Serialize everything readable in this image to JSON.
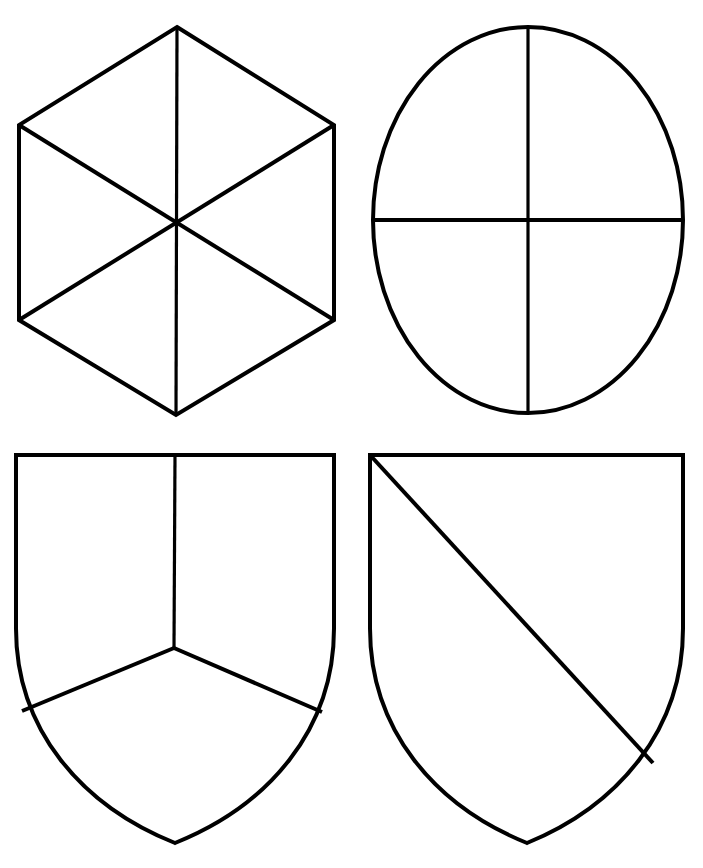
{
  "page": {
    "background_color": "#ffffff",
    "stroke_color": "#000000",
    "fill_color": "#ffffff",
    "width": 703,
    "height": 868
  },
  "figures": [
    {
      "id": "hexagon-gyronny",
      "name": "hexagon-divided-in-six",
      "shape": "hexagon",
      "divisions": 6,
      "division_type": "three-diameters-through-center",
      "stroke_width": 4,
      "vertices": [
        [
          177,
          27
        ],
        [
          334,
          125
        ],
        [
          334,
          320
        ],
        [
          176,
          415
        ],
        [
          19,
          320
        ],
        [
          19,
          125
        ]
      ],
      "center": [
        176,
        221
      ],
      "division_lines": [
        [
          [
            177,
            27
          ],
          [
            176,
            415
          ]
        ],
        [
          [
            19,
            125
          ],
          [
            334,
            320
          ]
        ],
        [
          [
            334,
            125
          ],
          [
            19,
            320
          ]
        ]
      ]
    },
    {
      "id": "ellipse-quartered",
      "name": "ellipse-quartered",
      "shape": "ellipse",
      "divisions": 4,
      "division_type": "vertical-and-horizontal-diameter",
      "stroke_width": 4,
      "center": [
        528,
        220
      ],
      "radius_x": 155,
      "radius_y": 193,
      "division_lines": [
        [
          [
            528,
            27
          ],
          [
            528,
            414
          ]
        ],
        [
          [
            373,
            220
          ],
          [
            683,
            220
          ]
        ]
      ]
    },
    {
      "id": "shield-per-pall",
      "name": "shield-party-per-pall",
      "shape": "shield",
      "divisions": 3,
      "division_type": "party-per-pall",
      "stroke_width": 4,
      "top_left": [
        16,
        455
      ],
      "top_right": [
        334,
        455
      ],
      "bottom_point": [
        175,
        843
      ],
      "pall_junction": [
        174,
        648
      ],
      "division_lines": [
        [
          [
            175,
            455
          ],
          [
            174,
            648
          ]
        ],
        [
          [
            174,
            648
          ],
          [
            22,
            711
          ]
        ],
        [
          [
            174,
            648
          ],
          [
            322,
            712
          ]
        ]
      ]
    },
    {
      "id": "shield-per-bend",
      "name": "shield-party-per-bend",
      "shape": "shield",
      "divisions": 2,
      "division_type": "party-per-bend",
      "stroke_width": 4,
      "top_left": [
        370,
        455
      ],
      "top_right": [
        683,
        455
      ],
      "bottom_point": [
        527,
        843
      ],
      "division_lines": [
        [
          [
            370,
            455
          ],
          [
            653,
            763
          ]
        ]
      ]
    }
  ]
}
